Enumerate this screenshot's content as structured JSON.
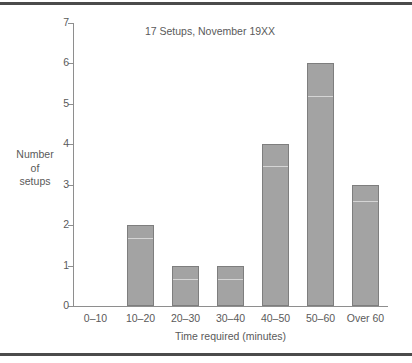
{
  "chart_data": {
    "type": "bar",
    "title": "17 Setups, November 19XX",
    "xlabel": "Time required (minutes)",
    "ylabel": "Number of setups",
    "ylabel_lines": [
      "Number",
      "of",
      "setups"
    ],
    "categories": [
      "0–10",
      "10–20",
      "20–30",
      "30–40",
      "40–50",
      "50–60",
      "Over 60"
    ],
    "values": [
      0,
      2,
      1,
      1,
      4,
      6,
      3
    ],
    "ylim": [
      0,
      7
    ],
    "ytick_labels": [
      "0",
      "1",
      "2",
      "3",
      "4",
      "5",
      "6",
      "7"
    ],
    "ytick_values": [
      0,
      1,
      2,
      3,
      4,
      5,
      6,
      7
    ],
    "grid": false,
    "legend": false,
    "bar_fill_color": "#a3a3a3",
    "bar_border_color": "#7e7e7e",
    "axis_color": "#8e8e8e",
    "text_color": "#5a5a5a",
    "rule_color": "#4b4b4b",
    "background_color": "#ffffff"
  }
}
